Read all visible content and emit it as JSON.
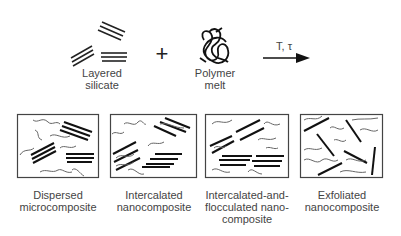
{
  "diagram": {
    "inputs": {
      "silicate_label_1": "Layered",
      "silicate_label_2": "silicate",
      "plus": "+",
      "polymer_label_1": "Polymer",
      "polymer_label_2": "melt",
      "arrow_label": "T, τ"
    },
    "outcomes": [
      {
        "line1": "Dispersed",
        "line2": "microcomposite",
        "line3": ""
      },
      {
        "line1": "Intercalated",
        "line2": "nanocomposite",
        "line3": ""
      },
      {
        "line1": "Intercalated-and-",
        "line2": "flocculated nano-",
        "line3": "composite"
      },
      {
        "line1": "Exfoliated",
        "line2": "nanocomposite",
        "line3": ""
      }
    ],
    "colors": {
      "platelet": "#111111",
      "polymer": "#555555",
      "box": "#444444"
    }
  }
}
